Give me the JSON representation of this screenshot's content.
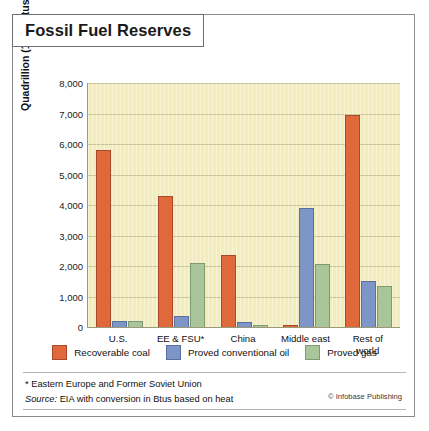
{
  "title": "Fossil Fuel Reserves",
  "chart_data": {
    "type": "bar",
    "title": "Fossil Fuel Reserves",
    "xlabel": "",
    "ylabel": "Quadrillion (10^15) Btus",
    "ylabel_prefix": "Quadrillion (10",
    "ylabel_exponent": "15",
    "ylabel_suffix": ") Btus",
    "ylim": [
      0,
      8000
    ],
    "ytick_step": 1000,
    "yticks": [
      "0",
      "1,000",
      "2,000",
      "3,000",
      "4,000",
      "5,000",
      "6,000",
      "7,000",
      "8,000"
    ],
    "grid": true,
    "legend_position": "bottom",
    "categories": [
      "U.S.",
      "EE & FSU*",
      "China",
      "Middle east",
      "Rest of\nworld"
    ],
    "category_labels": [
      {
        "line1": "U.S.",
        "line2": ""
      },
      {
        "line1": "EE & FSU*",
        "line2": ""
      },
      {
        "line1": "China",
        "line2": ""
      },
      {
        "line1": "Middle east",
        "line2": ""
      },
      {
        "line1": "Rest of",
        "line2": "world"
      }
    ],
    "series": [
      {
        "name": "Recoverable coal",
        "color": "#e0693b",
        "values": [
          5800,
          4300,
          2350,
          60,
          6950
        ]
      },
      {
        "name": "Proved conventional oil",
        "color": "#7d95c7",
        "values": [
          200,
          350,
          160,
          3900,
          1500
        ]
      },
      {
        "name": "Proved gas",
        "color": "#a9c69b",
        "values": [
          210,
          2100,
          50,
          2050,
          1350
        ]
      }
    ]
  },
  "legend": [
    {
      "label": "Recoverable coal",
      "key": "coal"
    },
    {
      "label": "Proved conventional oil",
      "key": "oil"
    },
    {
      "label": "Proved gas",
      "key": "gas"
    }
  ],
  "notes": {
    "footnote": "* Eastern Europe and Former Soviet Union",
    "source_label": "Source:",
    "source_text": " EIA with conversion in Btus based on heat",
    "credit": "© Infobase Publishing"
  }
}
